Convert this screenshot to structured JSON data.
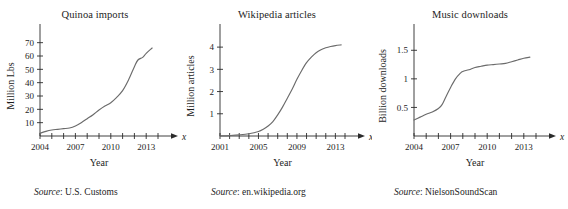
{
  "chart_data": [
    {
      "type": "line",
      "title": "Quinoa imports",
      "xlabel": "Year",
      "ylabel": "Million Lbs",
      "x_axis_var": "x",
      "y_axis_var": "y",
      "source_word": "Source",
      "source": "U.S. Customs",
      "grid": false,
      "legend": "none",
      "xlim": [
        2004,
        2014
      ],
      "ylim": [
        0,
        75
      ],
      "x_ticks": [
        2004,
        2005,
        2006,
        2007,
        2008,
        2009,
        2010,
        2011,
        2012,
        2013,
        2014
      ],
      "x_tick_labels": [
        "2004",
        "",
        "",
        "2007",
        "",
        "",
        "2010",
        "",
        "",
        "2013",
        ""
      ],
      "y_ticks": [
        10,
        20,
        30,
        40,
        50,
        60,
        70
      ],
      "y_tick_labels": [
        "10",
        "20",
        "30",
        "40",
        "50",
        "60",
        "70"
      ],
      "x": [
        2004,
        2004.5,
        2005,
        2005.5,
        2006,
        2006.5,
        2007,
        2007.5,
        2008,
        2008.5,
        2009,
        2009.5,
        2010,
        2010.5,
        2011,
        2011.5,
        2012,
        2012.3,
        2012.7,
        2013,
        2013.5
      ],
      "values": [
        2,
        3.5,
        4.5,
        5,
        5.5,
        6,
        7.5,
        10,
        13,
        16,
        19.5,
        22.5,
        25,
        29,
        34,
        42,
        52,
        57,
        59,
        62,
        66
      ]
    },
    {
      "type": "line",
      "title": "Wikipedia articles",
      "xlabel": "Year",
      "ylabel": "Million articles",
      "x_axis_var": "x",
      "y_axis_var": "y",
      "source_word": "Source",
      "source": "en.wikipedia.org",
      "grid": false,
      "legend": "none",
      "xlim": [
        2001,
        2014
      ],
      "ylim": [
        0,
        4.5
      ],
      "x_ticks": [
        2001,
        2002,
        2003,
        2004,
        2005,
        2006,
        2007,
        2008,
        2009,
        2010,
        2011,
        2012,
        2013,
        2014
      ],
      "x_tick_labels": [
        "2001",
        "",
        "",
        "",
        "2005",
        "",
        "",
        "",
        "2009",
        "",
        "",
        "",
        "2013",
        ""
      ],
      "y_ticks": [
        1,
        2,
        3,
        4
      ],
      "y_tick_labels": [
        "1",
        "2",
        "3",
        "4"
      ],
      "x": [
        2001,
        2002,
        2003,
        2004,
        2005,
        2005.5,
        2006,
        2006.5,
        2007,
        2007.5,
        2008,
        2008.5,
        2009,
        2009.5,
        2010,
        2010.5,
        2011,
        2011.5,
        2012,
        2012.5,
        2013,
        2013.6
      ],
      "values": [
        0.0,
        0.02,
        0.05,
        0.1,
        0.2,
        0.3,
        0.45,
        0.65,
        0.95,
        1.3,
        1.7,
        2.1,
        2.55,
        2.95,
        3.3,
        3.55,
        3.75,
        3.88,
        3.97,
        4.03,
        4.07,
        4.1
      ]
    },
    {
      "type": "line",
      "title": "Music downloads",
      "xlabel": "Year",
      "ylabel": "Billion downloads",
      "x_axis_var": "x",
      "y_axis_var": "y",
      "source_word": "Source",
      "source": "NielsonSoundScan",
      "grid": false,
      "legend": "none",
      "xlim": [
        2004,
        2014
      ],
      "ylim": [
        0,
        1.75
      ],
      "x_ticks": [
        2004,
        2005,
        2006,
        2007,
        2008,
        2009,
        2010,
        2011,
        2012,
        2013,
        2014
      ],
      "x_tick_labels": [
        "2004",
        "",
        "",
        "2007",
        "",
        "",
        "2010",
        "",
        "",
        "2013",
        ""
      ],
      "y_ticks": [
        0.5,
        1,
        1.5
      ],
      "y_tick_labels": [
        "0.5",
        "1",
        "1.5"
      ],
      "x": [
        2004,
        2004.5,
        2005,
        2005.5,
        2006,
        2006.3,
        2006.6,
        2007,
        2007.4,
        2007.8,
        2008,
        2008.5,
        2009,
        2009.5,
        2010,
        2010.5,
        2011,
        2011.5,
        2012,
        2012.5,
        2013,
        2013.5
      ],
      "values": [
        0.28,
        0.33,
        0.38,
        0.42,
        0.48,
        0.55,
        0.68,
        0.85,
        1.0,
        1.1,
        1.13,
        1.16,
        1.2,
        1.22,
        1.24,
        1.25,
        1.26,
        1.27,
        1.3,
        1.33,
        1.36,
        1.38
      ]
    }
  ]
}
